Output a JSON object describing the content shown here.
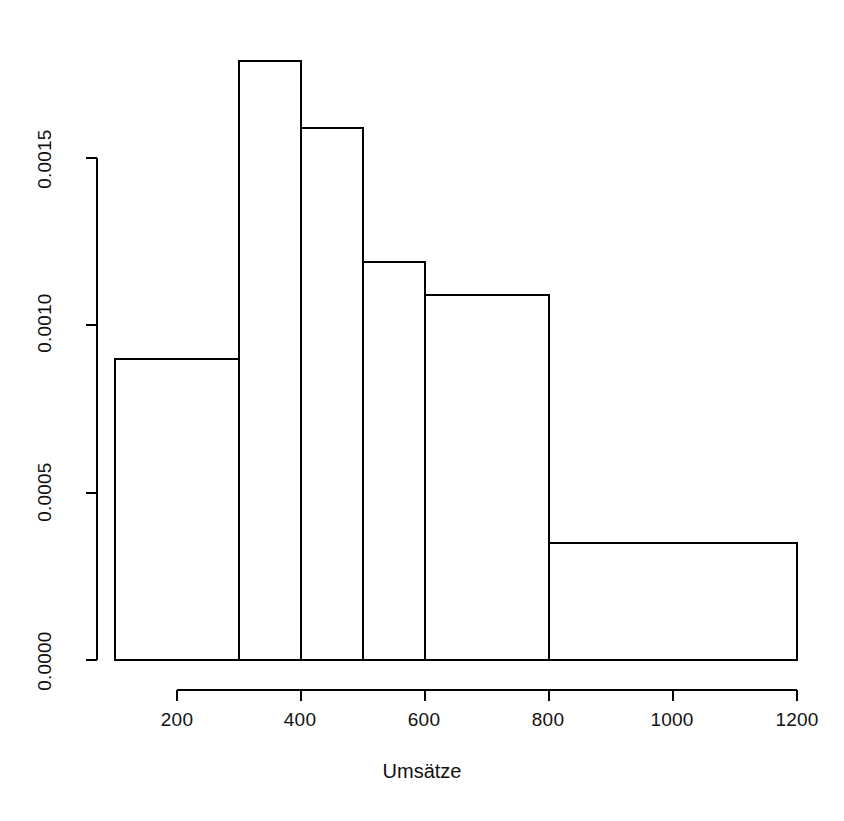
{
  "chart_data": {
    "type": "bar",
    "title": "",
    "subtitle": "",
    "xlabel": "Umsätze",
    "ylabel": "",
    "xlim": [
      100,
      1200
    ],
    "ylim": [
      0.0,
      0.00179
    ],
    "grid": false,
    "legend": null,
    "histogram": true,
    "bin_edges": [
      100,
      300,
      400,
      500,
      600,
      800,
      1200
    ],
    "categories": [
      "100-300",
      "300-400",
      "400-500",
      "500-600",
      "600-800",
      "800-1200"
    ],
    "values": [
      0.0009,
      0.00179,
      0.00159,
      0.00119,
      0.00109,
      0.00035
    ],
    "bars": [
      {
        "x0": 100,
        "x1": 300,
        "density": 0.0009
      },
      {
        "x0": 300,
        "x1": 400,
        "density": 0.00179
      },
      {
        "x0": 400,
        "x1": 500,
        "density": 0.00159
      },
      {
        "x0": 500,
        "x1": 600,
        "density": 0.00119
      },
      {
        "x0": 600,
        "x1": 800,
        "density": 0.00109
      },
      {
        "x0": 800,
        "x1": 1200,
        "density": 0.00035
      }
    ],
    "x_ticks": [
      200,
      400,
      600,
      800,
      1000,
      1200
    ],
    "x_tick_labels": [
      "200",
      "400",
      "600",
      "800",
      "1000",
      "1200"
    ],
    "y_ticks": [
      0.0,
      0.0005,
      0.001,
      0.0015
    ],
    "y_tick_labels": [
      "0.0000",
      "0.0005",
      "0.0010",
      "0.0015"
    ],
    "bar_fill_color": "#ffffff",
    "bar_line_color": "#000000",
    "axis_color": "#000000"
  },
  "axes": {
    "x_title": "Umsätze",
    "x_tick_labels": [
      "200",
      "400",
      "600",
      "800",
      "1000",
      "1200"
    ],
    "y_tick_labels": [
      "0.0000",
      "0.0005",
      "0.0010",
      "0.0015"
    ]
  }
}
